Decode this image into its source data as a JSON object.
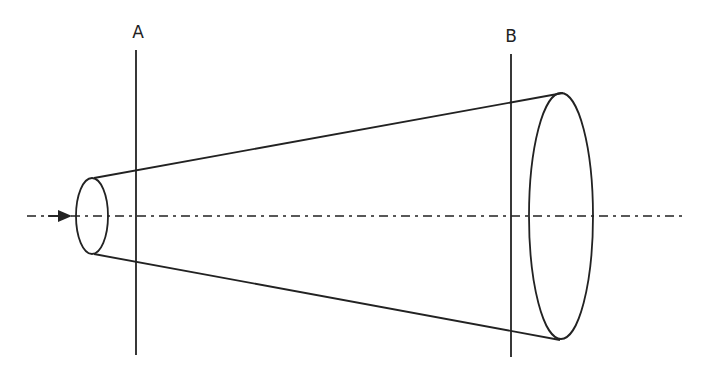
{
  "diagram": {
    "type": "conical-flow-tube",
    "labels": {
      "plane_a": "A",
      "plane_b": "B"
    },
    "colors": {
      "stroke": "#222222",
      "background": "#ffffff"
    },
    "elements": {
      "axis": {
        "style": "dash-dot",
        "direction": "left-to-right",
        "arrow": true
      },
      "small_end": {
        "shape": "ellipse"
      },
      "large_end": {
        "shape": "ellipse"
      },
      "section_lines": [
        "A",
        "B"
      ]
    }
  }
}
